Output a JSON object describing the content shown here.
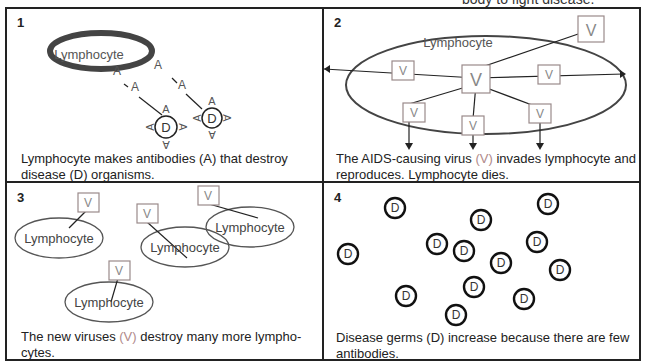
{
  "header": {
    "cut_text": "body to fight disease."
  },
  "panels": [
    {
      "number": "1",
      "labels": {
        "cell": "Lymphocyte",
        "antibody": "A",
        "disease": "D"
      },
      "caption": "Lymphocyte makes antibodies (A) that destroy disease (D) organisms."
    },
    {
      "number": "2",
      "labels": {
        "cell": "Lymphocyte",
        "virus": "V"
      },
      "caption_pre": "The AIDS-causing virus ",
      "caption_v": "(V)",
      "caption_post": " invades lymphocyte and reproduces. Lymphocyte dies."
    },
    {
      "number": "3",
      "labels": {
        "cell": "Lymphocyte",
        "virus": "V"
      },
      "caption_pre": "The new viruses ",
      "caption_v": "(V)",
      "caption_post": " destroy many more lympho-cytes."
    },
    {
      "number": "4",
      "labels": {
        "disease": "D"
      },
      "caption": "Disease germs (D) increase because there are few antibodies."
    }
  ],
  "colors": {
    "line": "#222222",
    "virus_box": "#9a8a8a",
    "ellipse": "#555555"
  }
}
